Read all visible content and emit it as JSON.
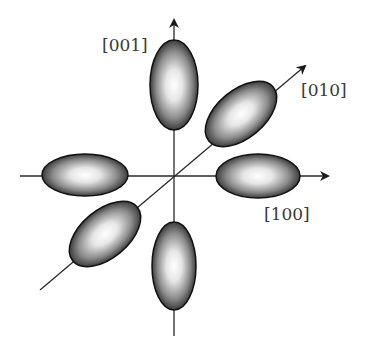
{
  "diagram": {
    "title": "",
    "axes": [
      {
        "id": "vertical",
        "label": "[001]"
      },
      {
        "id": "diagonal",
        "label": "[010]"
      },
      {
        "id": "horizontal",
        "label": "[100]"
      }
    ],
    "lobes": [
      {
        "id": "top",
        "axis": "[001]"
      },
      {
        "id": "bottom",
        "axis": "[001]"
      },
      {
        "id": "left",
        "axis": "[100]"
      },
      {
        "id": "right",
        "axis": "[100]"
      },
      {
        "id": "upper-right",
        "axis": "[010]"
      },
      {
        "id": "lower-left",
        "axis": "[010]"
      }
    ],
    "colors": {
      "line": "#2a2a2a",
      "lobe_edge": "#111111",
      "lobe_center": "#ffffff",
      "lobe_dark": "#3c3c3c"
    }
  }
}
